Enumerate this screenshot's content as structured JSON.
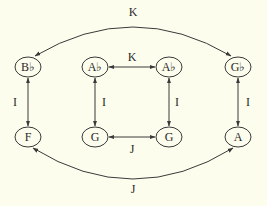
{
  "diagram": {
    "colors": {
      "background": "#fdfdee",
      "stroke": "#3a3a3a",
      "text": "#2a2a2a"
    },
    "nodes": [
      {
        "id": "n1",
        "label": "B♭",
        "x": 28,
        "y": 67
      },
      {
        "id": "n2",
        "label": "A♭",
        "x": 95,
        "y": 67
      },
      {
        "id": "n3",
        "label": "A♭",
        "x": 169,
        "y": 67
      },
      {
        "id": "n4",
        "label": "G♭",
        "x": 238,
        "y": 67
      },
      {
        "id": "n5",
        "label": "F",
        "x": 28,
        "y": 137
      },
      {
        "id": "n6",
        "label": "G",
        "x": 95,
        "y": 137
      },
      {
        "id": "n7",
        "label": "G",
        "x": 169,
        "y": 137
      },
      {
        "id": "n8",
        "label": "A",
        "x": 238,
        "y": 137
      }
    ],
    "edges": [
      {
        "from": "n4",
        "to": "n1",
        "label": "K",
        "type": "curved-top",
        "direction": "both"
      },
      {
        "from": "n2",
        "to": "n3",
        "label": "K",
        "type": "straight",
        "direction": "both"
      },
      {
        "from": "n6",
        "to": "n7",
        "label": "J",
        "type": "straight",
        "direction": "both"
      },
      {
        "from": "n5",
        "to": "n8",
        "label": "J",
        "type": "curved-bottom",
        "direction": "both"
      },
      {
        "from": "n1",
        "to": "n5",
        "label": "I",
        "type": "straight",
        "direction": "both"
      },
      {
        "from": "n2",
        "to": "n6",
        "label": "I",
        "type": "straight",
        "direction": "both"
      },
      {
        "from": "n3",
        "to": "n7",
        "label": "I",
        "type": "straight",
        "direction": "both"
      },
      {
        "from": "n4",
        "to": "n8",
        "label": "I",
        "type": "straight",
        "direction": "both"
      }
    ]
  },
  "labels": {
    "top_curve": "K",
    "middle_top": "K",
    "middle_bottom": "J",
    "bottom_curve": "J",
    "col1": "I",
    "col2": "I",
    "col3": "I",
    "col4": "I"
  },
  "nodes_text": {
    "b_flat": "B♭",
    "a_flat_left": "A♭",
    "a_flat_right": "A♭",
    "g_flat": "G♭",
    "f": "F",
    "g_left": "G",
    "g_right": "G",
    "a": "A"
  }
}
